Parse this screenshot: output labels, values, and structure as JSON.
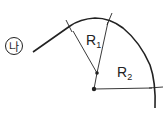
{
  "diagram": {
    "label_marker": "나",
    "labels": {
      "r1_base": "R",
      "r1_sub": "1",
      "r2_base": "R",
      "r2_sub": "2"
    },
    "colors": {
      "stroke": "#222222",
      "background": "#ffffff"
    }
  }
}
